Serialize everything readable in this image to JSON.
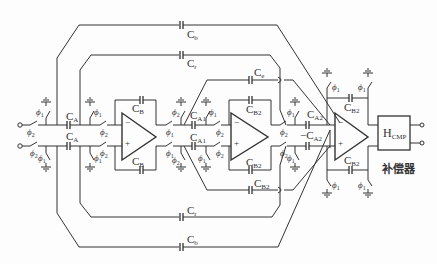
{
  "diagram": {
    "type": "switched-capacitor circuit schematic",
    "compensator_label": "补偿器",
    "block": {
      "name": "H",
      "sub": "CMP"
    },
    "capacitors": {
      "cb_top": {
        "name": "C",
        "sub": "b"
      },
      "cr_top": {
        "name": "C",
        "sub": "r"
      },
      "ce": {
        "name": "C",
        "sub": "e"
      },
      "ca_top": {
        "name": "C",
        "sub": "A"
      },
      "ca_bot": {
        "name": "C",
        "sub": "A"
      },
      "cB_top": {
        "name": "C",
        "sub": "B"
      },
      "cB_bot": {
        "name": "C",
        "sub": "B"
      },
      "ca1_top": {
        "name": "C",
        "sub": "A1"
      },
      "ca1_bot": {
        "name": "C",
        "sub": "A1"
      },
      "cb2_top": {
        "name": "C",
        "sub": "B2"
      },
      "cb2_bot": {
        "name": "C",
        "sub": "B2"
      },
      "cb2_mid": {
        "name": "C",
        "sub": "B2"
      },
      "ca2_top": {
        "name": "C",
        "sub": "A2"
      },
      "ca2_bot": {
        "name": "−C",
        "sub": "A2"
      },
      "cb2_out_top": {
        "name": "C",
        "sub": "B2"
      },
      "cb2_out_bot": {
        "name": "C",
        "sub": "B2"
      },
      "cr_bot": {
        "name": "C",
        "sub": "r"
      },
      "cb_bot": {
        "name": "C",
        "sub": "b"
      }
    },
    "phases": {
      "p1": "ϕ",
      "p1_sub": "1",
      "p2": "ϕ",
      "p2_sub": "2"
    },
    "opamps": [
      {
        "id": "amp1",
        "plus": "+",
        "minus": "−"
      },
      {
        "id": "amp2",
        "plus": "+",
        "minus": "−"
      },
      {
        "id": "amp3",
        "plus": "+",
        "minus": "−"
      }
    ]
  }
}
